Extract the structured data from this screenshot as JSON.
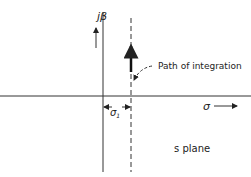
{
  "diagram": {
    "labels": {
      "imag_axis": "jβ",
      "real_axis": "σ",
      "offset": "σ",
      "offset_sub": "1",
      "path": "Path of integration",
      "plane": "s plane"
    },
    "colors": {
      "ink": "#222222",
      "background": "#ffffff"
    }
  }
}
